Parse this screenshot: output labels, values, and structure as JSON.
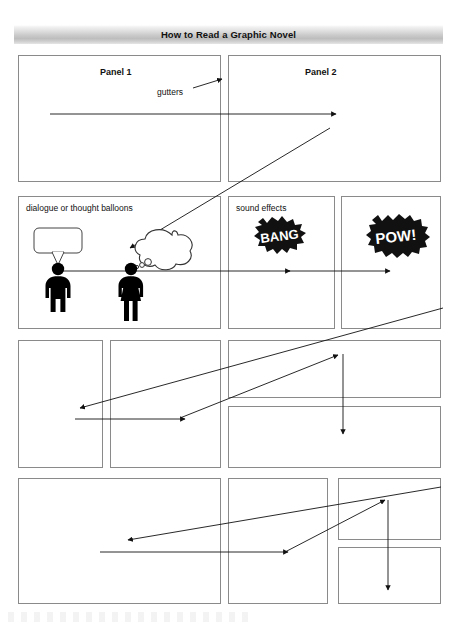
{
  "document": {
    "title": "How to Read a Graphic Novel",
    "page_width": 457,
    "page_height": 632,
    "background_color": "#ffffff",
    "panel_border_color": "#8a8a8a",
    "banner_gradient_from": "#ffffff",
    "banner_gradient_to": "#bdbdbd",
    "ink_color": "#000000"
  },
  "annotations": {
    "gutters": "gutters",
    "panel_1": "Panel 1",
    "panel_2": "Panel 2",
    "balloons": "dialogue or thought balloons",
    "sound_effects": "sound effects"
  },
  "sound_effects": {
    "bang": "BANG",
    "pow": "POW!"
  },
  "figures": {
    "speaker_label": "male-figure-with-speech-balloon",
    "thinker_label": "female-figure-with-thought-balloon"
  },
  "reading_order": {
    "description": "Z-path reading order arrows across panels",
    "arrow_count": 10
  },
  "grid": {
    "rows": [
      {
        "row": 1,
        "panels": [
          {
            "id": "r1c1",
            "label": "Panel 1",
            "x": 18,
            "y": 55,
            "w": 203,
            "h": 127
          },
          {
            "id": "r1c2",
            "label": "Panel 2",
            "x": 228,
            "y": 55,
            "w": 213,
            "h": 127
          }
        ]
      },
      {
        "row": 2,
        "panels": [
          {
            "id": "r2c1",
            "label": "dialogue or thought balloons",
            "x": 18,
            "y": 196,
            "w": 203,
            "h": 133
          },
          {
            "id": "r2c2",
            "label": "sound effects",
            "x": 228,
            "y": 196,
            "w": 107,
            "h": 133
          },
          {
            "id": "r2c3",
            "label": "",
            "x": 341,
            "y": 196,
            "w": 100,
            "h": 133
          }
        ]
      },
      {
        "row": 3,
        "panels": [
          {
            "id": "r3c1",
            "label": "",
            "x": 18,
            "y": 340,
            "w": 85,
            "h": 128
          },
          {
            "id": "r3c2",
            "label": "",
            "x": 110,
            "y": 340,
            "w": 111,
            "h": 128
          },
          {
            "id": "r3c3",
            "label": "",
            "x": 228,
            "y": 340,
            "w": 213,
            "h": 58
          },
          {
            "id": "r3c4",
            "label": "",
            "x": 228,
            "y": 406,
            "w": 213,
            "h": 62
          }
        ]
      },
      {
        "row": 4,
        "panels": [
          {
            "id": "r4c1",
            "label": "",
            "x": 18,
            "y": 478,
            "w": 203,
            "h": 126
          },
          {
            "id": "r4c2",
            "label": "",
            "x": 228,
            "y": 478,
            "w": 100,
            "h": 126
          },
          {
            "id": "r4c3",
            "label": "",
            "x": 338,
            "y": 478,
            "w": 103,
            "h": 62
          },
          {
            "id": "r4c4",
            "label": "",
            "x": 338,
            "y": 547,
            "w": 103,
            "h": 57
          }
        ]
      }
    ]
  }
}
